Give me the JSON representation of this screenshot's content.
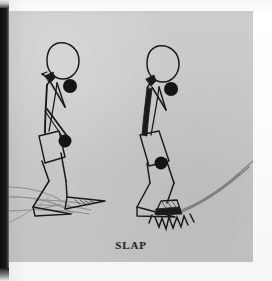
{
  "page": {
    "caption": "SLAP",
    "background_color": "#c9c9c9",
    "paper_color": "#fdfdfd",
    "ink_color": "#1a1a1a",
    "gutter_color": "#100f0f"
  },
  "illustration": {
    "title_alt": "Two stick figures demonstrating a skiing stride, the second landing with a foot slap",
    "figure_count": 2,
    "figures": [
      {
        "name": "left-figure",
        "label": "glide-phase-figure",
        "has_motion_lines": true,
        "ball_markers": 2
      },
      {
        "name": "right-figure",
        "label": "slap-phase-figure",
        "has_motion_lines": true,
        "has_impact_burst": true,
        "ball_markers": 2
      }
    ],
    "marker_color": "#141414",
    "motion_line_color": "#8c8c8c"
  }
}
